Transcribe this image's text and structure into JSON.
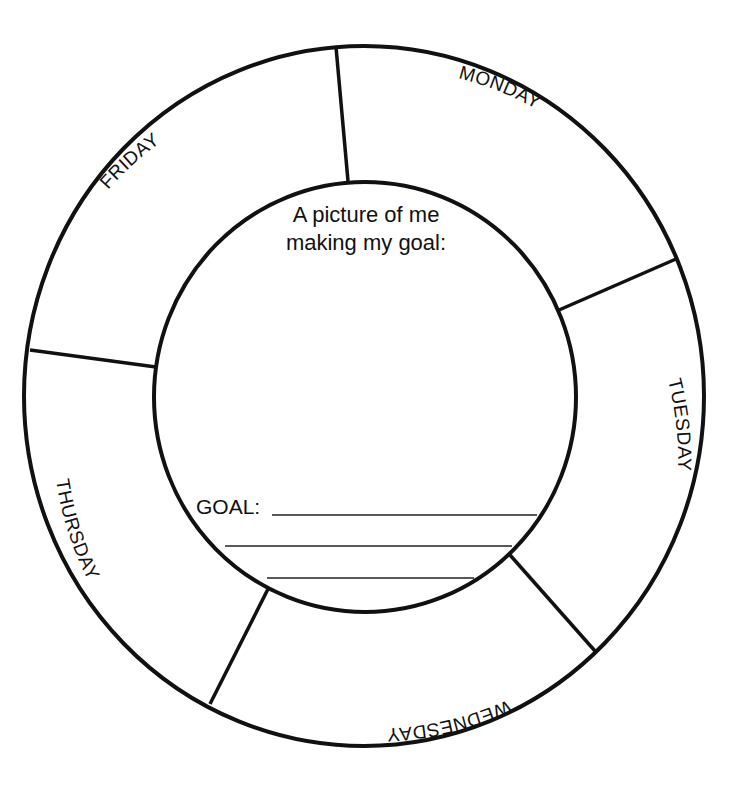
{
  "worksheet": {
    "center": {
      "prompt_line1": "A picture of me",
      "prompt_line2": "making my goal:",
      "goal_label": "GOAL:"
    },
    "days": [
      {
        "label": "MONDAY"
      },
      {
        "label": "TUESDAY"
      },
      {
        "label": "WEDNESDAY"
      },
      {
        "label": "THURSDAY"
      },
      {
        "label": "FRIDAY"
      }
    ],
    "colors": {
      "ink": "#111111",
      "paper": "#ffffff"
    }
  }
}
